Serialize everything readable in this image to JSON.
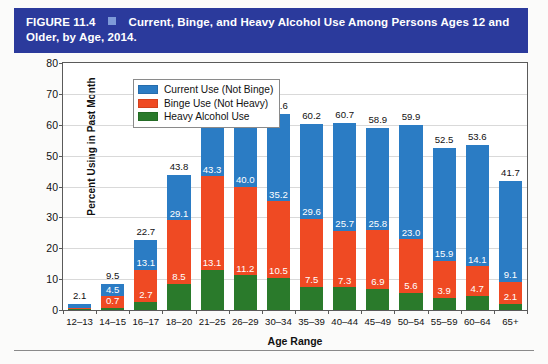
{
  "figure": {
    "number": "FIGURE 11.4",
    "marker_icon": "blue-square-icon",
    "title": "Current, Binge, and Heavy Alcohol Use Among Persons Ages 12 and Older, by Age, 2014.",
    "banner_color": "#2b3a9c",
    "marker_color": "#7e9ad8"
  },
  "chart_data": {
    "type": "bar",
    "subtype": "stacked",
    "title": "Current, Binge, and Heavy Alcohol Use Among Persons Ages 12 and Older, by Age, 2014.",
    "xlabel": "Age Range",
    "ylabel": "Percent Using in Past Month",
    "ylim": [
      0,
      80
    ],
    "yticks": [
      0,
      10,
      20,
      30,
      40,
      50,
      60,
      70,
      80
    ],
    "grid": true,
    "legend_position": "top-left-inside",
    "categories": [
      "12–13",
      "14–15",
      "16–17",
      "18–20",
      "21–25",
      "26–29",
      "30–34",
      "35–39",
      "40–44",
      "45–49",
      "50–54",
      "55–59",
      "60–64",
      "65+"
    ],
    "series": [
      {
        "name": "Current Use (Not Binge)",
        "color": "#2b7cc4",
        "stack_order": "top",
        "values": [
          1.4,
          3.8,
          9.6,
          14.7,
          26.0,
          29.0,
          28.4,
          30.6,
          35.0,
          33.1,
          36.9,
          36.6,
          39.5,
          32.6
        ]
      },
      {
        "name": "Binge Use (Not Heavy)",
        "color": "#ef4a23",
        "stack_order": "middle",
        "values": [
          0.4,
          3.8,
          10.4,
          20.6,
          30.2,
          28.8,
          24.7,
          22.1,
          18.4,
          18.9,
          17.4,
          12.0,
          9.4,
          7.0
        ]
      },
      {
        "name": "Heavy Alcohol Use",
        "color": "#2a7a2b",
        "stack_order": "bottom",
        "values": [
          0.3,
          0.7,
          2.7,
          8.5,
          13.1,
          11.2,
          10.5,
          7.5,
          7.3,
          6.9,
          5.6,
          3.9,
          4.7,
          2.1
        ]
      }
    ],
    "cumulative_labels": {
      "total": [
        2.1,
        9.5,
        22.7,
        43.8,
        69.3,
        69.0,
        63.6,
        60.2,
        60.7,
        58.9,
        59.9,
        52.5,
        53.6,
        41.7
      ],
      "binge_plus_heavy": [
        null,
        4.5,
        13.1,
        29.1,
        43.3,
        40.0,
        35.2,
        29.6,
        25.7,
        25.8,
        23.0,
        15.9,
        14.1,
        9.1
      ],
      "heavy": [
        null,
        0.7,
        2.7,
        8.5,
        13.1,
        11.2,
        10.5,
        7.5,
        7.3,
        6.9,
        5.6,
        3.9,
        4.7,
        2.1
      ]
    }
  },
  "legend": {
    "items": [
      {
        "label": "Current Use (Not Binge)",
        "color": "#2b7cc4",
        "swatch_icon": "blue-swatch-icon"
      },
      {
        "label": "Binge Use (Not Heavy)",
        "color": "#ef4a23",
        "swatch_icon": "red-swatch-icon"
      },
      {
        "label": "Heavy Alcohol Use",
        "color": "#2a7a2b",
        "swatch_icon": "green-swatch-icon"
      }
    ]
  }
}
